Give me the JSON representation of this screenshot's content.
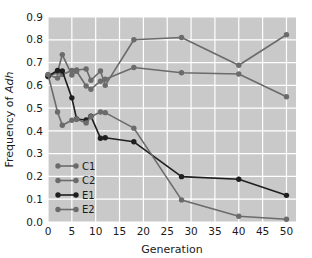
{
  "chart_data": {
    "type": "line",
    "title": "",
    "xlabel": "Generation",
    "ylabel": "Frequency of Adh",
    "ylabel_plain": "Frequency of ",
    "ylabel_italic": "Adh",
    "xlim": [
      0,
      52
    ],
    "ylim": [
      0.0,
      0.9
    ],
    "grid": true,
    "legend_position": "lower-left-inside",
    "xticks": [
      0,
      5,
      10,
      15,
      20,
      25,
      30,
      35,
      40,
      45,
      50
    ],
    "xtick_labels": [
      "0",
      "5",
      "10",
      "15",
      "20",
      "25",
      "30",
      "35",
      "40",
      "45",
      "50"
    ],
    "yticks": [
      0.0,
      0.1,
      0.2,
      0.3,
      0.4,
      0.5,
      0.6,
      0.7,
      0.8,
      0.9
    ],
    "ytick_labels": [
      "0.0",
      "0.1",
      "0.2",
      "0.3",
      "0.4",
      "0.5",
      "0.6",
      "0.7",
      "0.8",
      "0.9"
    ],
    "plot_bg_color": "#c9c9c9",
    "grid_color": "#ffffff",
    "series": [
      {
        "name": "C1",
        "color": "#6b6b6b",
        "x": [
          0,
          2,
          3,
          5,
          6,
          8,
          9,
          11,
          12,
          18,
          28,
          40,
          50
        ],
        "y": [
          0.645,
          0.632,
          0.648,
          0.665,
          0.667,
          0.672,
          0.622,
          0.663,
          0.6,
          0.8,
          0.81,
          0.688,
          0.822
        ]
      },
      {
        "name": "C2",
        "color": "#6b6b6b",
        "x": [
          0,
          2,
          3,
          5,
          6,
          8,
          9,
          11,
          12,
          18,
          28,
          40,
          50
        ],
        "y": [
          0.638,
          0.657,
          0.735,
          0.645,
          0.662,
          0.597,
          0.583,
          0.618,
          0.627,
          0.678,
          0.655,
          0.65,
          0.55
        ]
      },
      {
        "name": "E1",
        "color": "#1f1f1f",
        "x": [
          0,
          2,
          3,
          5,
          6,
          8,
          9,
          11,
          12,
          18,
          28,
          40,
          50
        ],
        "y": [
          0.64,
          0.665,
          0.663,
          0.545,
          0.452,
          0.448,
          0.465,
          0.368,
          0.37,
          0.352,
          0.199,
          0.188,
          0.117
        ]
      },
      {
        "name": "E2",
        "color": "#6b6b6b",
        "x": [
          0,
          2,
          3,
          5,
          6,
          8,
          9,
          11,
          12,
          18,
          28,
          40,
          50
        ],
        "y": [
          0.648,
          0.483,
          0.425,
          0.447,
          0.452,
          0.435,
          0.462,
          0.483,
          0.48,
          0.412,
          0.097,
          0.025,
          0.012
        ]
      }
    ]
  },
  "legend": {
    "items": [
      {
        "label": "C1"
      },
      {
        "label": "C2"
      },
      {
        "label": "E1"
      },
      {
        "label": "E2"
      }
    ]
  }
}
